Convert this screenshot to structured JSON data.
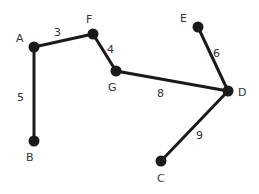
{
  "graph": {
    "nodes": [
      {
        "id": "A",
        "label": "A",
        "x": 34,
        "y": 47,
        "lx": 16,
        "ly": 42
      },
      {
        "id": "F",
        "label": "F",
        "x": 93,
        "y": 34,
        "lx": 86,
        "ly": 23
      },
      {
        "id": "G",
        "label": "G",
        "x": 116,
        "y": 71,
        "lx": 108,
        "ly": 91
      },
      {
        "id": "E",
        "label": "E",
        "x": 198,
        "y": 27,
        "lx": 180,
        "ly": 22
      },
      {
        "id": "D",
        "label": "D",
        "x": 228,
        "y": 91,
        "lx": 238,
        "ly": 96
      },
      {
        "id": "B",
        "label": "B",
        "x": 34,
        "y": 141,
        "lx": 26,
        "ly": 161
      },
      {
        "id": "C",
        "label": "C",
        "x": 161,
        "y": 161,
        "lx": 157,
        "ly": 182
      }
    ],
    "edges": [
      {
        "from": "A",
        "to": "F",
        "weight": "3",
        "lx": 54,
        "ly": 36
      },
      {
        "from": "F",
        "to": "G",
        "weight": "4",
        "lx": 107,
        "ly": 53
      },
      {
        "from": "A",
        "to": "B",
        "weight": "5",
        "lx": 17,
        "ly": 101
      },
      {
        "from": "G",
        "to": "D",
        "weight": "8",
        "lx": 157,
        "ly": 97
      },
      {
        "from": "E",
        "to": "D",
        "weight": "6",
        "lx": 213,
        "ly": 57
      },
      {
        "from": "D",
        "to": "C",
        "weight": "9",
        "lx": 196,
        "ly": 139
      }
    ]
  }
}
